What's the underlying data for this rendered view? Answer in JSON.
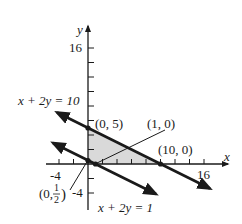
{
  "diagram": {
    "type": "linear-inequality-feasible-region",
    "axes": {
      "x_label": "x",
      "y_label": "y",
      "x_ticks_labeled": [
        "-4",
        "16"
      ],
      "y_ticks_labeled": [
        "16",
        "-4"
      ],
      "tick_step": 2
    },
    "lines": [
      {
        "label": "x + 2y = 10",
        "equation": "x + 2y = 10"
      },
      {
        "label": "x + 2y = 1",
        "equation": "x + 2y = 1"
      }
    ],
    "points": [
      {
        "label": "(0, 5)",
        "x": 0,
        "y": 5
      },
      {
        "label": "(1, 0)",
        "x": 1,
        "y": 0
      },
      {
        "label": "(10, 0)",
        "x": 10,
        "y": 0
      },
      {
        "label_prefix": "(0, ",
        "frac_num": "1",
        "frac_den": "2",
        "label_suffix": ")",
        "x": 0,
        "y": 0.5
      }
    ],
    "shaded_region": "triangle with vertices (0,0), (0,5), (10,0)",
    "colors": {
      "line": "#1a1a1a",
      "shade": "#d9d9d9"
    }
  }
}
